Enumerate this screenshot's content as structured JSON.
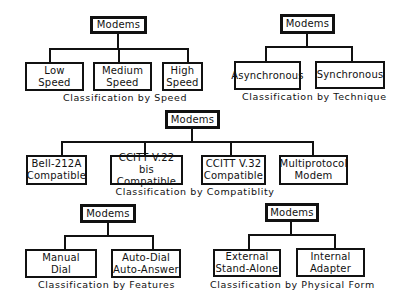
{
  "diagrams": [
    {
      "root": "Modems",
      "children": [
        "Low\nSpeed",
        "Medium\nSpeed",
        "High\nSpeed"
      ],
      "caption": "Classification by Speed"
    },
    {
      "root": "Modems",
      "children": [
        "Asynchronous",
        "Synchronous"
      ],
      "caption": "Classification by Technique"
    },
    {
      "root": "Modems",
      "children": [
        "Bell-212A\nCompatible",
        "CCITT V.22 bis\nCompatible",
        "CCITT V.32\nCompatible",
        "Multiprotocol\nModem"
      ],
      "caption": "Classification by Compatiblity"
    },
    {
      "root": "Modems",
      "children": [
        "Manual\nDial",
        "Auto-Dial\nAuto-Answer"
      ],
      "caption": "Classification by Features"
    },
    {
      "root": "Modems",
      "children": [
        "External\nStand-Alone",
        "Internal\nAdapter"
      ],
      "caption": "Classification by Physical Form"
    }
  ]
}
